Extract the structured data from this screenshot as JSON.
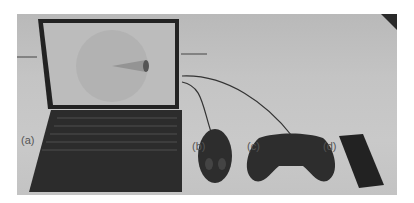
{
  "figure": {
    "labels": {
      "a": "(a)",
      "b": "(b)",
      "c": "(c)",
      "d": "(d)"
    },
    "items": [
      {
        "id": "a",
        "name": "laptop",
        "screen": "circular radar-like display with cone"
      },
      {
        "id": "b",
        "name": "mouse"
      },
      {
        "id": "c",
        "name": "gamepad"
      },
      {
        "id": "d",
        "name": "smartphone"
      }
    ],
    "colors": {
      "table": "#c6c6c6",
      "device": "#2b2b2b",
      "screen": "#bdbdbd"
    }
  }
}
